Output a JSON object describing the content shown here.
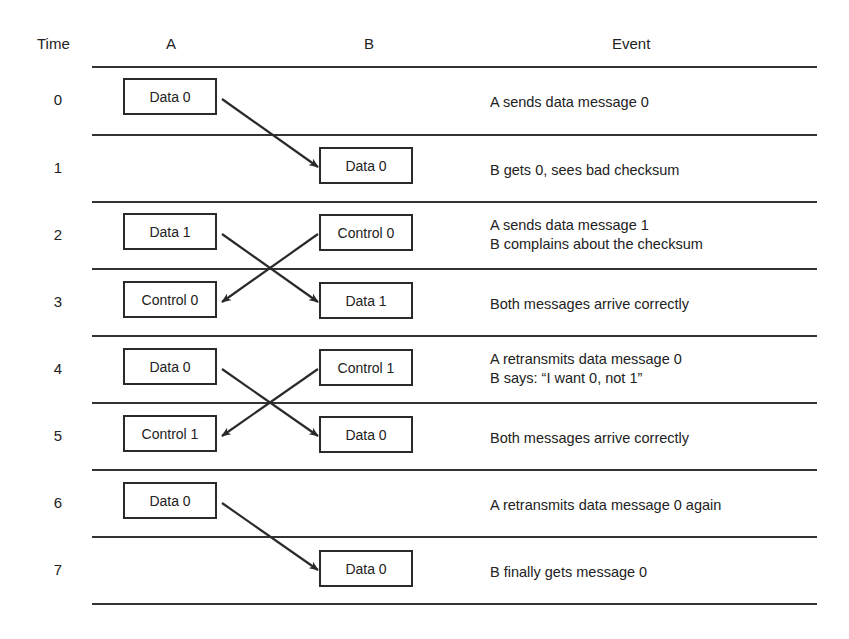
{
  "headers": {
    "time": "Time",
    "a": "A",
    "b": "B",
    "event": "Event"
  },
  "rows": [
    {
      "time": "0",
      "a": "Data 0",
      "b": "",
      "event": "A sends data message 0"
    },
    {
      "time": "1",
      "a": "",
      "b": "Data 0",
      "event": "B gets 0, sees bad checksum"
    },
    {
      "time": "2",
      "a": "Data 1",
      "b": "Control 0",
      "event": "A sends data message 1\nB complains about the checksum"
    },
    {
      "time": "3",
      "a": "Control 0",
      "b": "Data 1",
      "event": "Both messages arrive correctly"
    },
    {
      "time": "4",
      "a": "Data 0",
      "b": "Control 1",
      "event": "A retransmits data message 0\nB says: “I want 0, not 1”"
    },
    {
      "time": "5",
      "a": "Control 1",
      "b": "Data 0",
      "event": "Both messages arrive correctly"
    },
    {
      "time": "6",
      "a": "Data 0",
      "b": "",
      "event": "A retransmits data message 0 again"
    },
    {
      "time": "7",
      "a": "",
      "b": "Data 0",
      "event": "B finally gets message 0"
    }
  ],
  "arrows": [
    {
      "from": "A@0",
      "to": "B@1"
    },
    {
      "from": "A@2",
      "to": "B@3"
    },
    {
      "from": "B@2",
      "to": "A@3"
    },
    {
      "from": "A@4",
      "to": "B@5"
    },
    {
      "from": "B@4",
      "to": "A@5"
    },
    {
      "from": "A@6",
      "to": "B@7"
    }
  ]
}
